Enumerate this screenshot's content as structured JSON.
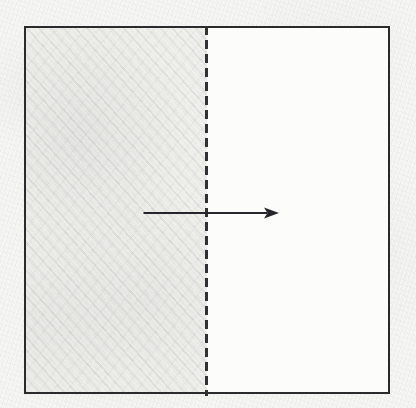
{
  "diagram": {
    "kind": "paper-folding-instruction",
    "title": "Fold right half over to the left along the dashed centre line",
    "medium": "pencil on paper (scanned)",
    "canvas": {
      "width": 416,
      "height": 408,
      "background_color": "#f6f6f4"
    },
    "sheet": {
      "label": "square sheet of paper",
      "x": 24,
      "y": 26,
      "width": 366,
      "height": 368,
      "stroke_color": "#2b2b2e",
      "stroke_width": 2,
      "fill_color": "#fcfcfb"
    },
    "shaded_region": {
      "label": "shaded left half",
      "side": "left",
      "x": 24,
      "y": 26,
      "width": 181,
      "height": 368,
      "fill_color": "#f2f2f0",
      "hatch_color": "#78787d",
      "hatch_angle_deg": 48
    },
    "fold_line": {
      "label": "dashed vertical fold line",
      "orientation": "vertical",
      "x": 206,
      "y_start": 26,
      "y_end": 394,
      "style": "dashed",
      "dash_length": 9,
      "gap_length": 5,
      "stroke_width": 3,
      "stroke_color": "#313134"
    },
    "arrow": {
      "label": "fold direction arrow",
      "direction": "right",
      "x_start": 144,
      "x_end": 281,
      "y": 213,
      "stroke_color": "#26262a",
      "stroke_width": 2,
      "head_length": 15,
      "head_width": 11,
      "head_filled": true
    }
  }
}
